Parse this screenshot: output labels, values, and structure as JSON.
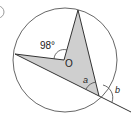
{
  "diagram": {
    "type": "circle-theorem",
    "labels": {
      "angle_at_center": "98°",
      "center": "O",
      "angle_a": "a",
      "angle_b": "b"
    },
    "colors": {
      "stroke": "#333333",
      "fill": "#c8c8c8"
    }
  }
}
